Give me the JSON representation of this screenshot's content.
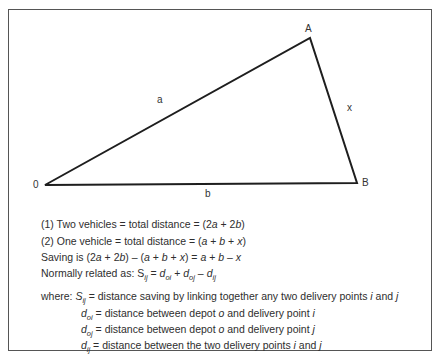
{
  "diagram": {
    "vertices": [
      {
        "id": "O",
        "label": "0",
        "x": 45,
        "y": 185
      },
      {
        "id": "A",
        "label": "A",
        "x": 310,
        "y": 38
      },
      {
        "id": "B",
        "label": "B",
        "x": 357,
        "y": 183
      }
    ],
    "edges": [
      {
        "from": "O",
        "to": "A",
        "label": "a"
      },
      {
        "from": "A",
        "to": "B",
        "label": "x"
      },
      {
        "from": "O",
        "to": "B",
        "label": "b"
      }
    ],
    "stroke_color": "#1e1e1e"
  },
  "equations": {
    "line1": {
      "prefix": "(1) Two vehicles = total distance = (2",
      "v1": "a",
      "mid": " + 2",
      "v2": "b",
      "suffix": ")"
    },
    "line2": {
      "prefix": "(2) One vehicle = total distance = (",
      "v1": "a",
      "p1": " + ",
      "v2": "b",
      "p2": " + ",
      "v3": "x",
      "suffix": ")"
    },
    "line3": {
      "prefix": "Saving is (2",
      "v1": "a",
      "m1": " + 2",
      "v2": "b",
      "m2": ") – (",
      "v3": "a",
      "m3": " + ",
      "v4": "b",
      "m4": " + ",
      "v5": "x",
      "m5": ") = ",
      "v6": "a",
      "m6": " + ",
      "v7": "b",
      "m7": " – ",
      "v8": "x"
    },
    "line4": {
      "prefix": "Normally related as: S",
      "s_sub": "ij",
      "eq": " = ",
      "d1": "d",
      "d1_sub": "oi",
      "plus": " + ",
      "d2": "d",
      "d2_sub": "oj",
      "minus": " – ",
      "d3": "d",
      "d3_sub": "ij"
    }
  },
  "definitions": {
    "where_label": "where: ",
    "items": [
      {
        "sym": "S",
        "sub": "ij",
        "text_a": " = distance saving by linking together any two delivery points ",
        "v1": "i",
        "text_b": " and ",
        "v2": "j"
      },
      {
        "sym": "d",
        "sub": "oi",
        "text_a": " = distance between depot ",
        "v1": "o",
        "text_b": " and delivery point ",
        "v2": "i"
      },
      {
        "sym": "d",
        "sub": "oj",
        "text_a": " = distance between depot ",
        "v1": "o",
        "text_b": " and delivery point ",
        "v2": "j"
      },
      {
        "sym": "d",
        "sub": "ij",
        "text_a": " = distance between the two delivery points ",
        "v1": "i",
        "text_b": " and ",
        "v2": "j"
      }
    ]
  }
}
